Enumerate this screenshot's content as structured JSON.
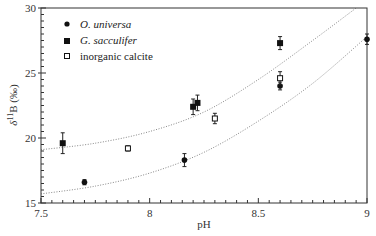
{
  "chart_data": {
    "type": "scatter",
    "title": "",
    "xlabel": "pH",
    "ylabel": "δ11B (‰)",
    "xlim": [
      7.5,
      9.0
    ],
    "ylim": [
      15,
      30
    ],
    "x_ticks": [
      "7.5",
      "8",
      "8.5",
      "9"
    ],
    "y_ticks": [
      "15",
      "20",
      "25",
      "30"
    ],
    "grid": false,
    "legend_position": "upper-left",
    "series": [
      {
        "name": "O. universa",
        "marker": "filled-circle",
        "points": [
          {
            "x": 7.7,
            "y": 16.6,
            "err": 0.2
          },
          {
            "x": 8.16,
            "y": 18.3,
            "err": 0.5
          },
          {
            "x": 8.6,
            "y": 24.0,
            "err": 0.3
          },
          {
            "x": 9.0,
            "y": 27.6,
            "err": 0.4
          }
        ]
      },
      {
        "name": "G. sacculifer",
        "marker": "filled-square",
        "points": [
          {
            "x": 7.6,
            "y": 19.6,
            "err": 0.8
          },
          {
            "x": 8.2,
            "y": 22.4,
            "err": 0.6
          },
          {
            "x": 8.22,
            "y": 22.7,
            "err": 0.6
          },
          {
            "x": 8.6,
            "y": 27.3,
            "err": 0.5
          }
        ]
      },
      {
        "name": "inorganic calcite",
        "marker": "open-square",
        "points": [
          {
            "x": 7.9,
            "y": 19.2,
            "err": 0.2
          },
          {
            "x": 8.3,
            "y": 21.5,
            "err": 0.4
          },
          {
            "x": 8.6,
            "y": 24.6,
            "err": 0.5
          }
        ]
      }
    ],
    "curves": [
      {
        "name": "upper dotted curve",
        "style": "dotted",
        "points": [
          [
            7.5,
            19.1
          ],
          [
            7.75,
            19.6
          ],
          [
            8.0,
            20.5
          ],
          [
            8.25,
            22.0
          ],
          [
            8.5,
            24.5
          ],
          [
            8.75,
            27.5
          ],
          [
            8.95,
            30.0
          ]
        ]
      },
      {
        "name": "lower dotted curve",
        "style": "dotted",
        "points": [
          [
            7.5,
            15.7
          ],
          [
            7.75,
            16.3
          ],
          [
            8.0,
            17.3
          ],
          [
            8.25,
            18.9
          ],
          [
            8.5,
            21.3
          ],
          [
            8.75,
            24.2
          ],
          [
            9.0,
            27.8
          ]
        ]
      }
    ]
  },
  "legend": {
    "items": [
      {
        "label": "O. universa",
        "italic": true
      },
      {
        "label": "G. sacculifer",
        "italic": true
      },
      {
        "label": "inorganic calcite",
        "italic": false
      }
    ]
  },
  "axes": {
    "x_label": "pH",
    "y_label_prefix": "δ",
    "y_label_sup": "11",
    "y_label_suffix": "B (‰)"
  }
}
